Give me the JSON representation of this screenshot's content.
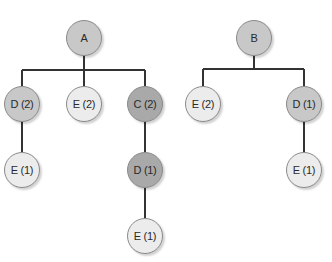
{
  "diagram": {
    "type": "tree",
    "colors": {
      "edge": "#333333",
      "light": "#ececec",
      "medium": "#c8c8c8",
      "dark": "#a9a9a9"
    },
    "trees": [
      {
        "root": "A",
        "nodes": [
          {
            "id": "a",
            "label": "A",
            "x": 84,
            "y": 38,
            "shade": "medium"
          },
          {
            "id": "a_d2",
            "label": "D (2)",
            "x": 22,
            "y": 104,
            "shade": "medium"
          },
          {
            "id": "a_e2",
            "label": "E (2)",
            "x": 84,
            "y": 104,
            "shade": "light"
          },
          {
            "id": "a_c2",
            "label": "C (2)",
            "x": 145,
            "y": 104,
            "shade": "dark"
          },
          {
            "id": "a_d2_e1",
            "label": "E (1)",
            "x": 22,
            "y": 170,
            "shade": "light"
          },
          {
            "id": "a_c2_d1",
            "label": "D (1)",
            "x": 145,
            "y": 170,
            "shade": "dark"
          },
          {
            "id": "a_c2_d1_e1",
            "label": "E (1)",
            "x": 145,
            "y": 236,
            "shade": "light"
          }
        ]
      },
      {
        "root": "B",
        "nodes": [
          {
            "id": "b",
            "label": "B",
            "x": 254,
            "y": 38,
            "shade": "medium"
          },
          {
            "id": "b_e2",
            "label": "E (2)",
            "x": 203,
            "y": 104,
            "shade": "light"
          },
          {
            "id": "b_d1",
            "label": "D (1)",
            "x": 304,
            "y": 104,
            "shade": "medium"
          },
          {
            "id": "b_d1_e1",
            "label": "E (1)",
            "x": 304,
            "y": 170,
            "shade": "light"
          }
        ]
      }
    ]
  }
}
